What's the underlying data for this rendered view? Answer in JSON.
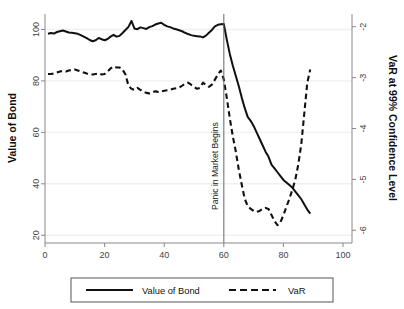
{
  "chart_data": {
    "type": "line",
    "title": "",
    "xlabel": "",
    "ylabel": "Value of Bond",
    "y2label": "VaR at 99% Confidence Level",
    "xlim": [
      0,
      103
    ],
    "ylim": [
      17,
      106
    ],
    "y2lim": [
      -6.25,
      -1.75
    ],
    "grid": true,
    "legend_position": "bottom-center",
    "xticks": [
      0,
      20,
      40,
      60,
      80,
      100
    ],
    "xtick_labels": [
      "0",
      "20",
      "40",
      "60",
      "80",
      "100"
    ],
    "yticks": [
      20,
      40,
      60,
      80,
      100
    ],
    "ytick_labels": [
      "20",
      "40",
      "60",
      "80",
      "100"
    ],
    "y2ticks": [
      -2,
      -3,
      -4,
      -5,
      -6
    ],
    "y2tick_labels": [
      "-2",
      "-3",
      "-4",
      "-5",
      "-6"
    ],
    "annotations": [
      {
        "name": "panic-line",
        "text": "Panic in Market Begins",
        "x": 60,
        "orientation": "vertical"
      }
    ],
    "series": [
      {
        "name": "Value of Bond",
        "axis": "left",
        "style": "solid",
        "color": "#111111",
        "x": [
          1,
          2,
          3,
          4,
          5,
          6,
          7,
          8,
          9,
          10,
          11,
          12,
          13,
          14,
          15,
          16,
          17,
          18,
          19,
          20,
          21,
          22,
          23,
          24,
          25,
          26,
          27,
          28,
          29,
          30,
          31,
          32,
          33,
          34,
          35,
          36,
          37,
          38,
          39,
          40,
          41,
          42,
          43,
          44,
          45,
          46,
          47,
          48,
          49,
          50,
          51,
          52,
          53,
          54,
          55,
          56,
          57,
          58,
          59,
          60,
          61,
          62,
          63,
          64,
          65,
          66,
          67,
          68,
          69,
          70,
          71,
          72,
          73,
          74,
          75,
          76,
          77,
          78,
          79,
          80,
          81,
          82,
          83,
          84,
          85,
          86,
          87,
          88,
          89
        ],
        "values": [
          98.3,
          98.6,
          98.4,
          99.0,
          99.3,
          99.6,
          99.2,
          98.8,
          98.7,
          98.5,
          98.3,
          97.8,
          97.2,
          96.6,
          95.9,
          95.4,
          95.8,
          96.7,
          96.2,
          95.8,
          96.3,
          97.2,
          97.9,
          97.2,
          97.5,
          98.6,
          99.8,
          101.0,
          103.3,
          100.4,
          100.1,
          100.8,
          100.5,
          100.2,
          100.9,
          101.3,
          101.9,
          102.3,
          102.6,
          101.8,
          101.2,
          100.9,
          100.4,
          100.1,
          99.7,
          99.3,
          98.7,
          98.2,
          97.8,
          97.5,
          97.4,
          97.3,
          96.9,
          97.6,
          98.7,
          99.8,
          101.2,
          101.8,
          102.0,
          102.1,
          96.0,
          90.5,
          86.0,
          82.0,
          78.0,
          73.5,
          69.5,
          66.0,
          64.5,
          62.5,
          60.0,
          57.5,
          55.0,
          52.5,
          50.5,
          47.5,
          46.0,
          44.5,
          43.0,
          41.5,
          40.5,
          39.5,
          38.5,
          37.0,
          35.5,
          34.0,
          32.0,
          30.0,
          28.4
        ]
      },
      {
        "name": "VaR",
        "axis": "right",
        "style": "dashed",
        "color": "#111111",
        "x": [
          1,
          2,
          3,
          4,
          5,
          6,
          7,
          8,
          9,
          10,
          11,
          12,
          13,
          14,
          15,
          16,
          17,
          18,
          19,
          20,
          21,
          22,
          23,
          24,
          25,
          26,
          27,
          28,
          29,
          30,
          31,
          32,
          33,
          34,
          35,
          36,
          37,
          38,
          39,
          40,
          41,
          42,
          43,
          44,
          45,
          46,
          47,
          48,
          49,
          50,
          51,
          52,
          53,
          54,
          55,
          56,
          57,
          58,
          59,
          60,
          61,
          62,
          63,
          64,
          65,
          66,
          67,
          68,
          69,
          70,
          71,
          72,
          73,
          74,
          75,
          76,
          77,
          78,
          79,
          80,
          81,
          82,
          83,
          84,
          85,
          86,
          87,
          88,
          89
        ],
        "values": [
          -2.93,
          -2.93,
          -2.92,
          -2.9,
          -2.88,
          -2.87,
          -2.88,
          -2.86,
          -2.85,
          -2.84,
          -2.86,
          -2.88,
          -2.9,
          -2.92,
          -2.93,
          -2.94,
          -2.93,
          -2.92,
          -2.94,
          -2.93,
          -2.88,
          -2.82,
          -2.78,
          -2.8,
          -2.8,
          -2.84,
          -2.94,
          -3.16,
          -3.22,
          -3.24,
          -3.2,
          -3.24,
          -3.28,
          -3.3,
          -3.31,
          -3.29,
          -3.27,
          -3.28,
          -3.27,
          -3.26,
          -3.25,
          -3.24,
          -3.22,
          -3.21,
          -3.2,
          -3.16,
          -3.12,
          -3.1,
          -3.14,
          -3.18,
          -3.22,
          -3.2,
          -3.1,
          -3.14,
          -3.18,
          -3.14,
          -3.04,
          -2.94,
          -2.86,
          -3.04,
          -3.4,
          -3.8,
          -4.15,
          -4.45,
          -4.8,
          -5.1,
          -5.38,
          -5.52,
          -5.58,
          -5.62,
          -5.64,
          -5.62,
          -5.58,
          -5.56,
          -5.58,
          -5.7,
          -5.82,
          -5.9,
          -5.84,
          -5.7,
          -5.54,
          -5.38,
          -5.2,
          -5.0,
          -4.7,
          -4.3,
          -3.7,
          -3.1,
          -2.84
        ]
      }
    ]
  },
  "legend": {
    "items": [
      {
        "label": "Value of Bond",
        "style": "solid"
      },
      {
        "label": "VaR",
        "style": "dashed"
      }
    ]
  }
}
